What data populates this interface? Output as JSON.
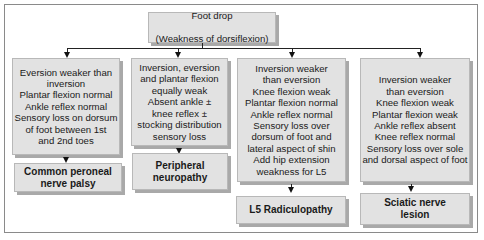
{
  "diagram": {
    "title": {
      "line1": "Foot drop",
      "line2": "(Weakness of dorsiflexion)"
    },
    "branches": [
      {
        "findings": "Eversion weaker than\ninversion\nPlantar flexion normal\nAnkle reflex normal\nSensory loss on dorsum\nof foot between 1st\nand 2nd toes",
        "diagnosis": "Common peroneal\nnerve palsy"
      },
      {
        "findings": "Inversion, eversion\nand plantar flexion\nequally weak\nAbsent ankle ±\nknee reflex ±\nstocking distribution\nsensory loss",
        "diagnosis": "Peripheral\nneuropathy"
      },
      {
        "findings": "Inversion weaker\nthan eversion\nKnee flexion weak\nPlantar flexion normal\nAnkle reflex normal\nSensory loss over\ndorsum of foot and\nlateral aspect of shin\nAdd hip extension\nweakness for L5",
        "diagnosis": "L5 Radiculopathy"
      },
      {
        "findings": "Inversion weaker\nthan eversion\nKnee flexion weak\nPlantar flexion weak\nAnkle reflex absent\nKnee reflex normal\nSensory loss over sole\nand dorsal aspect of foot",
        "diagnosis": "Sciatic nerve\nlesion"
      }
    ],
    "colors": {
      "box_fill": "#e2e2e2",
      "box_shadow": "#a9a9a9",
      "line": "#222222",
      "frame": "#8a8a8a"
    }
  }
}
